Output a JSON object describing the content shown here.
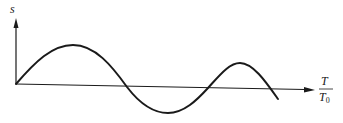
{
  "diagram": {
    "y_axis_label": "s",
    "x_axis_label_numerator": "T",
    "x_axis_label_denominator": "T",
    "x_axis_label_denominator_subscript": "0",
    "curve_description": "oscillating wave starting at origin: rises to a peak, crosses axis, dips to trough, crosses axis, rises to a smaller peak, then descends below the axis",
    "colors": {
      "stroke": "#1a1a1a",
      "background": "#ffffff"
    }
  }
}
